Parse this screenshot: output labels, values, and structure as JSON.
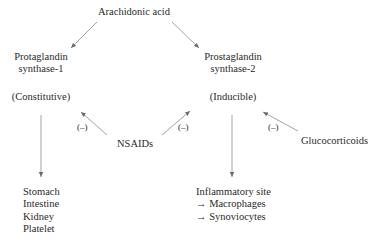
{
  "diagram": {
    "title_node": "Arachidonic acid",
    "enzyme1": {
      "name_line1": "Protaglandin",
      "name_line2": "synthase-1",
      "type": "(Constitutive)"
    },
    "enzyme2": {
      "name_line1": "Prostaglandin",
      "name_line2": "synthase-2",
      "type": "(Inducible)"
    },
    "inhibitor_nsaids": "NSAIDs",
    "inhibitor_glucocorticoids": "Glucocorticoids",
    "inhibition_label": "(–)",
    "targets1": [
      "Stomach",
      "Intestine",
      "Kidney",
      "Platelet"
    ],
    "targets2": [
      "Inflammatory site",
      "→ Macrophages",
      "→ Synoviocytes"
    ],
    "colors": {
      "line": "#7a7a7a",
      "text": "#2a2a2a"
    }
  }
}
